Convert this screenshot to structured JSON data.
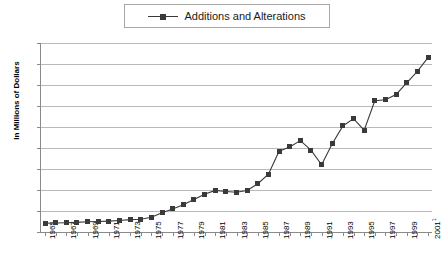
{
  "legend": {
    "entries": [
      {
        "label": "Additions and Alterations",
        "color": "#3a3a3a",
        "marker": "square"
      }
    ],
    "position": "top-center",
    "border": true
  },
  "axes": {
    "ylabel": "In Millions of Dollars",
    "ytick_labels": [
      "$90,000",
      "$80,000",
      "$70,000",
      "$60,000",
      "$50,000",
      "$40,000",
      "$30,000",
      "$20,000",
      "$10,000",
      "$0"
    ],
    "xtick_labels": [
      "1965",
      "1967",
      "1969",
      "1971",
      "1973",
      "1975",
      "1977",
      "1979",
      "1981",
      "1983",
      "1985",
      "1987",
      "1989",
      "1991",
      "1993",
      "1995",
      "1997",
      "1999",
      "2001"
    ],
    "xlast_superscript": "1"
  },
  "colors": {
    "series": "#3a3a3a",
    "gridline": "#b9b9b9",
    "axis": "#8a8a8a",
    "background": "#ffffff",
    "legend_border": "#a8a8a8"
  },
  "chart_data": {
    "type": "line",
    "title": "",
    "xlabel": "",
    "ylabel": "In Millions of Dollars",
    "ylim": [
      0,
      90000
    ],
    "ytick_step": 10000,
    "grid": true,
    "legend_position": "top-center",
    "x": [
      1965,
      1966,
      1967,
      1968,
      1969,
      1970,
      1971,
      1972,
      1973,
      1974,
      1975,
      1976,
      1977,
      1978,
      1979,
      1980,
      1981,
      1982,
      1983,
      1984,
      1985,
      1986,
      1987,
      1988,
      1989,
      1990,
      1991,
      1992,
      1993,
      1994,
      1995,
      1996,
      1997,
      1998,
      1999,
      2000,
      2001
    ],
    "xtick_labels": [
      "1965",
      "1967",
      "1969",
      "1971",
      "1973",
      "1975",
      "1977",
      "1979",
      "1981",
      "1983",
      "1985",
      "1987",
      "1989",
      "1991",
      "1993",
      "1995",
      "1997",
      "1999",
      "2001"
    ],
    "series": [
      {
        "name": "Additions and Alterations",
        "color": "#3a3a3a",
        "marker": "square",
        "values": [
          4200,
          4300,
          4400,
          4600,
          4900,
          5000,
          5200,
          5500,
          5900,
          6100,
          7000,
          9200,
          11000,
          13000,
          15500,
          18000,
          19800,
          19300,
          18900,
          19800,
          23000,
          27500,
          38500,
          40500,
          43500,
          39000,
          32000,
          42000,
          50500,
          54000,
          48500,
          62500,
          63000,
          65500,
          71000,
          76500,
          83000
        ]
      }
    ]
  }
}
